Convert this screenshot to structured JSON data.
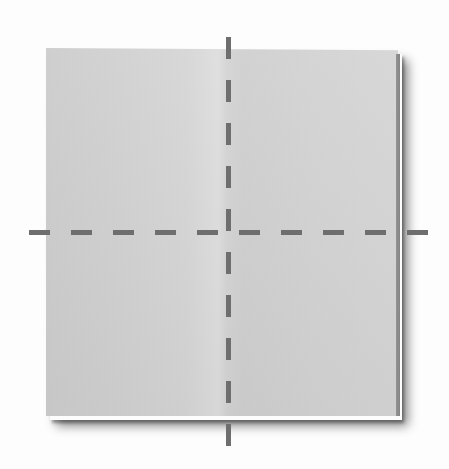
{
  "diagram": {
    "type": "origami-fold-diagram",
    "paper": {
      "shape": "square",
      "color": "#d3d3d3",
      "bounds": {
        "left": 46,
        "top": 48,
        "right": 398,
        "bottom": 416
      }
    },
    "fold_lines": [
      {
        "id": "vertical-center-fold",
        "orientation": "vertical",
        "style": "dashed",
        "color": "#6e6e6e",
        "x": 228,
        "y_start": 37,
        "y_end": 455,
        "thickness": 5,
        "dash_length": 22,
        "gap_length": 21
      },
      {
        "id": "horizontal-center-fold",
        "orientation": "horizontal",
        "style": "dashed",
        "color": "#6e6e6e",
        "y": 232,
        "x_start": 29,
        "x_end": 429,
        "thickness": 5,
        "dash_length": 21,
        "gap_length": 21
      }
    ],
    "crease": {
      "orientation": "vertical",
      "x": 228
    },
    "colors": {
      "background": "#ffffff",
      "paper": "#d3d3d3",
      "fold_line": "#6e6e6e",
      "shadow": "#6a6a6a"
    }
  }
}
